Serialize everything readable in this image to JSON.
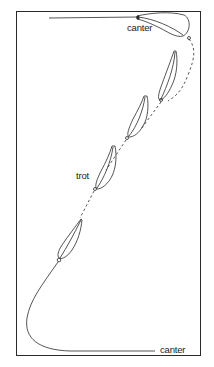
{
  "diagram": {
    "labels": {
      "canter_top": "canter",
      "trot": "trot",
      "canter_bottom": "canter"
    },
    "colors": {
      "stroke": "#2a2a2a",
      "background": "#ffffff"
    },
    "elements": [
      {
        "type": "straight-track",
        "gait": "canter",
        "position": "top"
      },
      {
        "type": "hoofprint-shape",
        "count": 5
      },
      {
        "type": "dashed-transition-path",
        "gait": "trot"
      },
      {
        "type": "curved-track",
        "gait": "canter",
        "position": "bottom"
      }
    ]
  }
}
